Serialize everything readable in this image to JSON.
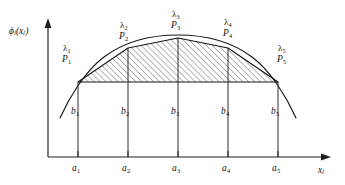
{
  "figure": {
    "caption_present": false,
    "axes": {
      "y_label": "ϕ",
      "y_label_sub": "j",
      "y_label_tail": "(x",
      "y_label_tail_sub": "j",
      "y_label_close": ")",
      "y_label_full": "ϕⱼ(xⱼ)",
      "x_label": "x",
      "x_label_sub": "j",
      "x_label_full": "xⱼ",
      "x_axis_y": 157,
      "y_axis_x": 48,
      "x_axis_right_end": 330,
      "y_axis_top_end": 20
    },
    "colors": {
      "ink": "#101010",
      "curve": "#1a1a1a",
      "hatch": "#3a3a3a",
      "background": "#ffffff",
      "axis": "#2a2a2a"
    },
    "breakpoints": [
      {
        "id": 1,
        "lambda_label": "λ",
        "lambda_sub": "1",
        "point_label": "P",
        "point_sub": "1",
        "b_label": "b",
        "b_sub": "1",
        "a_label": "a",
        "a_sub": "1",
        "x_px": 78,
        "y_px": 82,
        "lambda_x": 63,
        "lambda_y": 44,
        "p_x": 63,
        "p_y": 55,
        "b_x": 71,
        "b_y": 107,
        "a_x": 71,
        "a_y": 164
      },
      {
        "id": 2,
        "lambda_label": "λ",
        "lambda_sub": "2",
        "point_label": "P",
        "point_sub": "2",
        "b_label": "b",
        "b_sub": "2",
        "a_label": "a",
        "a_sub": "2",
        "x_px": 128,
        "y_px": 48,
        "lambda_x": 120,
        "lambda_y": 21,
        "p_x": 120,
        "p_y": 32,
        "b_x": 121,
        "b_y": 107,
        "a_x": 121,
        "a_y": 164
      },
      {
        "id": 3,
        "lambda_label": "λ",
        "lambda_sub": "3",
        "point_label": "P",
        "point_sub": "3",
        "b_label": "b",
        "b_sub": "3",
        "a_label": "a",
        "a_sub": "3",
        "x_px": 178,
        "y_px": 38,
        "lambda_x": 172,
        "lambda_y": 10,
        "p_x": 172,
        "p_y": 21,
        "b_x": 171,
        "b_y": 107,
        "a_x": 171,
        "a_y": 164
      },
      {
        "id": 4,
        "lambda_label": "λ",
        "lambda_sub": "4",
        "point_label": "P",
        "point_sub": "4",
        "b_label": "b",
        "b_sub": "4",
        "a_label": "a",
        "a_sub": "4",
        "x_px": 228,
        "y_px": 48,
        "lambda_x": 224,
        "lambda_y": 18,
        "p_x": 224,
        "p_y": 29,
        "b_x": 221,
        "b_y": 107,
        "a_x": 221,
        "a_y": 164
      },
      {
        "id": 5,
        "lambda_label": "λ",
        "lambda_sub": "5",
        "point_label": "P",
        "point_sub": "5",
        "b_label": "b",
        "b_sub": "5",
        "a_label": "a",
        "a_sub": "5",
        "x_px": 278,
        "y_px": 82,
        "lambda_x": 278,
        "lambda_y": 44,
        "p_x": 278,
        "p_y": 55,
        "b_x": 271,
        "b_y": 107,
        "a_x": 271,
        "a_y": 164
      }
    ],
    "curve": {
      "description": "smooth concave curve extending past the outer breakpoints",
      "path": "M 60,116 C 70,96 86,70 104,56 C 124,41 150,34 178,34 C 206,34 232,41 252,56 C 270,70 286,96 296,116",
      "extends_left_to_x": 60,
      "extends_right_to_x": 296
    },
    "chord_path": {
      "description": "piecewise linear interpolation joining P1 through P5",
      "points": "78,82 128,48 178,38 228,48 278,82"
    },
    "baseline": {
      "description": "horizontal chord joining P1 and P5",
      "y_px": 82,
      "x_start": 78,
      "x_end": 278
    },
    "hatching": {
      "description": "diagonal line fill between chord path and baseline",
      "angle_deg": 45,
      "spacing_px": 3
    },
    "tick_marks": {
      "length_px": 6,
      "count": 5
    }
  }
}
